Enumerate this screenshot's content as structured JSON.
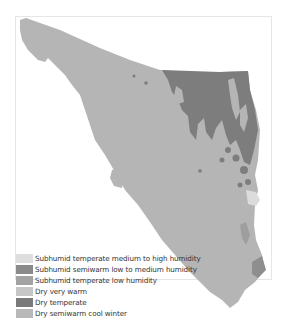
{
  "map": {
    "region": "Sonora climate zones",
    "colors": {
      "base": "#b5b5b5",
      "dry_temperate": "#7d7d7d",
      "subhumid_semiwarm": "#8e8e8e",
      "subhumid_temperate_high": "#dcdcdc",
      "frame_border": "#e6e6e6",
      "background": "#ffffff"
    }
  },
  "legend": {
    "items": [
      {
        "label": "Subhumid temperate medium to high humidity",
        "color": "#dedede"
      },
      {
        "label": "Subhumid semiwarm low to medium humidity",
        "color": "#8a8a8a"
      },
      {
        "label": "Subhumid temperate low humidity",
        "color": "#a3a3a3"
      },
      {
        "label": "Dry very warm",
        "color": "#c6c6c6"
      },
      {
        "label": "Dry temperate",
        "color": "#7a7a7a"
      },
      {
        "label": "Dry semiwarm cool winter",
        "color": "#b8b8b8"
      }
    ]
  }
}
